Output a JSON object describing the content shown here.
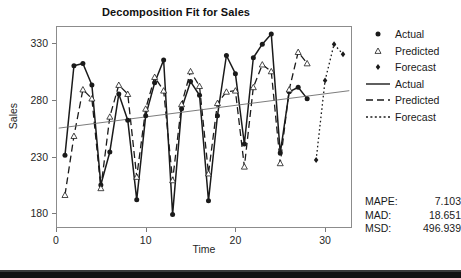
{
  "chart_data": {
    "type": "line",
    "title": "Decomposition Fit for Sales",
    "xlabel": "Time",
    "ylabel": "Sales",
    "xlim": [
      0,
      33
    ],
    "ylim": [
      167,
      345
    ],
    "xticks": [
      0,
      10,
      20,
      30
    ],
    "yticks": [
      180,
      230,
      280,
      330
    ],
    "grid": false,
    "legend_position": "right",
    "series": [
      {
        "name": "Actual",
        "style": "solid",
        "marker": "filled-circle",
        "x": [
          1,
          2,
          3,
          4,
          5,
          6,
          7,
          8,
          9,
          10,
          11,
          12,
          13,
          14,
          15,
          16,
          17,
          18,
          19,
          20,
          21,
          22,
          23,
          24,
          25,
          26,
          27,
          28
        ],
        "values": [
          231,
          310,
          312,
          293,
          205,
          234,
          285,
          262,
          192,
          266,
          295,
          315,
          179,
          272,
          296,
          284,
          191,
          266,
          319,
          303,
          241,
          317,
          329,
          338,
          233,
          287,
          291,
          281
        ]
      },
      {
        "name": "Predicted",
        "style": "dashed",
        "marker": "open-triangle",
        "x": [
          1,
          2,
          3,
          4,
          5,
          6,
          7,
          8,
          9,
          10,
          11,
          12,
          13,
          14,
          15,
          16,
          17,
          18,
          19,
          20,
          21,
          22,
          23,
          24,
          25,
          26,
          27,
          28
        ],
        "values": [
          196,
          248,
          289,
          281,
          202,
          265,
          293,
          285,
          212,
          272,
          300,
          288,
          209,
          276,
          305,
          292,
          215,
          277,
          287,
          288,
          221,
          291,
          311,
          305,
          224,
          289,
          322,
          312
        ]
      },
      {
        "name": "Forecast",
        "style": "dotted",
        "marker": "filled-diamond",
        "x": [
          29,
          30,
          31,
          32
        ],
        "values": [
          227,
          297,
          329,
          320
        ]
      },
      {
        "name": "Trend",
        "style": "solid-thin",
        "marker": "none",
        "x": [
          0.3,
          32.7
        ],
        "values": [
          255,
          288
        ]
      }
    ],
    "legend_entries": [
      {
        "label": "Actual",
        "symbol": "filled-circle",
        "kind": "marker"
      },
      {
        "label": "Predicted",
        "symbol": "open-triangle",
        "kind": "marker"
      },
      {
        "label": "Forecast",
        "symbol": "filled-diamond",
        "kind": "marker"
      },
      {
        "label": "Actual",
        "symbol": "solid-line",
        "kind": "line"
      },
      {
        "label": "Predicted",
        "symbol": "dashed-line",
        "kind": "line"
      },
      {
        "label": "Forecast",
        "symbol": "dotted-line",
        "kind": "line"
      }
    ],
    "accuracy_measures": [
      {
        "label": "MAPE:",
        "value": "7.103"
      },
      {
        "label": "MAD:",
        "value": "18.651"
      },
      {
        "label": "MSD:",
        "value": "496.939"
      }
    ]
  },
  "colors": {
    "ink": "#1a1a1a",
    "axis": "#8c8c8c",
    "trend": "#6d6d6d",
    "background": "#ffffff",
    "bottom_bar": "#121212"
  }
}
